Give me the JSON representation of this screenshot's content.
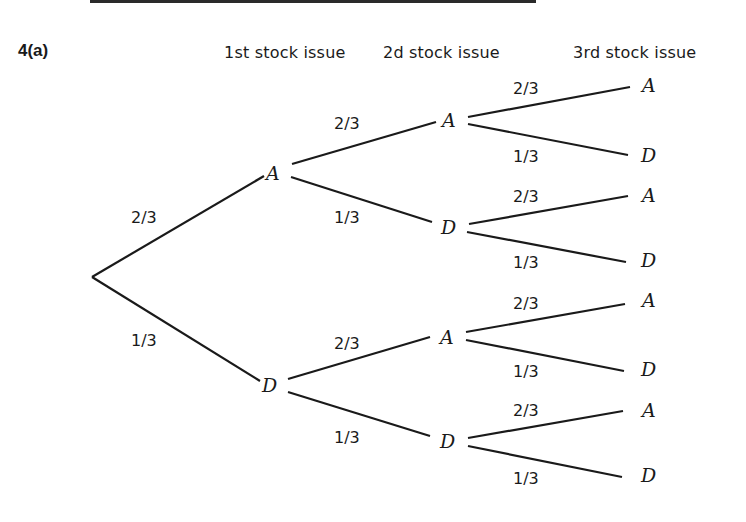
{
  "figure": {
    "section_label": "4(a)",
    "column_headers": [
      "1st stock issue",
      "2d stock issue",
      "3rd stock issue"
    ]
  },
  "tree": {
    "root": "",
    "level1": [
      {
        "node": "A",
        "prob": "2/3"
      },
      {
        "node": "D",
        "prob": "1/3"
      }
    ],
    "level2": [
      {
        "parent": "A",
        "node": "A",
        "prob": "2/3"
      },
      {
        "parent": "A",
        "node": "D",
        "prob": "1/3"
      },
      {
        "parent": "D",
        "node": "A",
        "prob": "2/3"
      },
      {
        "parent": "D",
        "node": "D",
        "prob": "1/3"
      }
    ],
    "level3": [
      {
        "path": "AA",
        "node": "A",
        "prob": "2/3"
      },
      {
        "path": "AA",
        "node": "D",
        "prob": "1/3"
      },
      {
        "path": "AD",
        "node": "A",
        "prob": "2/3"
      },
      {
        "path": "AD",
        "node": "D",
        "prob": "1/3"
      },
      {
        "path": "DA",
        "node": "A",
        "prob": "2/3"
      },
      {
        "path": "DA",
        "node": "D",
        "prob": "1/3"
      },
      {
        "path": "DD",
        "node": "A",
        "prob": "2/3"
      },
      {
        "path": "DD",
        "node": "D",
        "prob": "1/3"
      }
    ]
  }
}
